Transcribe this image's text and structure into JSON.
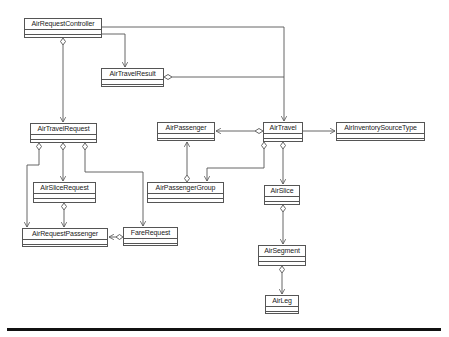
{
  "diagram": {
    "type": "UML class diagram",
    "classes": [
      {
        "id": "AirRequestController",
        "label": "AirRequestController",
        "x": 24,
        "y": 18,
        "w": 78,
        "h": 20
      },
      {
        "id": "AirTravelResult",
        "label": "AirTravelResult",
        "x": 101,
        "y": 68,
        "w": 63,
        "h": 19
      },
      {
        "id": "AirTravelRequest",
        "label": "AirTravelRequest",
        "x": 30,
        "y": 123,
        "w": 67,
        "h": 20
      },
      {
        "id": "AirPassenger",
        "label": "AirPassenger",
        "x": 157,
        "y": 122,
        "w": 58,
        "h": 19
      },
      {
        "id": "AirTravel",
        "label": "AirTravel",
        "x": 263,
        "y": 122,
        "w": 40,
        "h": 20
      },
      {
        "id": "AirInventorySourceType",
        "label": "AirInventorySourceType",
        "x": 336,
        "y": 122,
        "w": 89,
        "h": 19
      },
      {
        "id": "AirSliceRequest",
        "label": "AirSliceRequest",
        "x": 33,
        "y": 182,
        "w": 63,
        "h": 21
      },
      {
        "id": "AirPassengerGroup",
        "label": "AirPassengerGroup",
        "x": 147,
        "y": 182,
        "w": 77,
        "h": 21
      },
      {
        "id": "AirSlice",
        "label": "AirSlice",
        "x": 264,
        "y": 185,
        "w": 36,
        "h": 20
      },
      {
        "id": "AirRequestPassenger",
        "label": "AirRequestPassenger",
        "x": 22,
        "y": 228,
        "w": 86,
        "h": 19
      },
      {
        "id": "FareRequest",
        "label": "FareRequest",
        "x": 123,
        "y": 227,
        "w": 55,
        "h": 19
      },
      {
        "id": "AirSegment",
        "label": "AirSegment",
        "x": 258,
        "y": 245,
        "w": 48,
        "h": 21
      },
      {
        "id": "AirLeg",
        "label": "AirLeg",
        "x": 265,
        "y": 295,
        "w": 34,
        "h": 19
      }
    ],
    "relationships": [
      {
        "from": "AirRequestController",
        "to": "AirTravelRequest",
        "kind": "aggregation"
      },
      {
        "from": "AirRequestController",
        "to": "AirTravelResult",
        "kind": "association"
      },
      {
        "from": "AirRequestController",
        "to": "AirTravel",
        "kind": "association"
      },
      {
        "from": "AirTravelResult",
        "to": "AirTravel",
        "kind": "aggregation"
      },
      {
        "from": "AirTravelRequest",
        "to": "AirRequestPassenger",
        "kind": "aggregation"
      },
      {
        "from": "AirTravelRequest",
        "to": "AirSliceRequest",
        "kind": "aggregation"
      },
      {
        "from": "AirTravelRequest",
        "to": "FareRequest",
        "kind": "aggregation"
      },
      {
        "from": "AirSliceRequest",
        "to": "AirRequestPassenger",
        "kind": "aggregation"
      },
      {
        "from": "FareRequest",
        "to": "AirRequestPassenger",
        "kind": "aggregation"
      },
      {
        "from": "AirTravel",
        "to": "AirPassenger",
        "kind": "aggregation"
      },
      {
        "from": "AirTravel",
        "to": "AirInventorySourceType",
        "kind": "association"
      },
      {
        "from": "AirTravel",
        "to": "AirPassengerGroup",
        "kind": "aggregation"
      },
      {
        "from": "AirTravel",
        "to": "AirSlice",
        "kind": "aggregation"
      },
      {
        "from": "AirPassengerGroup",
        "to": "AirPassenger",
        "kind": "aggregation"
      },
      {
        "from": "AirSlice",
        "to": "AirSegment",
        "kind": "aggregation"
      },
      {
        "from": "AirSegment",
        "to": "AirLeg",
        "kind": "aggregation"
      }
    ]
  },
  "colors": {
    "line": "#555555",
    "rule": "#111111",
    "background": "#ffffff"
  }
}
